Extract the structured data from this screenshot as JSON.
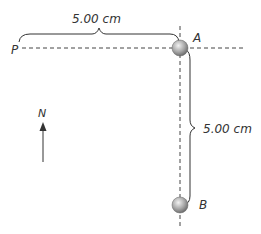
{
  "diagram": {
    "top_distance_label": "5.00 cm",
    "side_distance_label": "5.00 cm",
    "point_p_label": "P",
    "ball_a_label": "A",
    "ball_b_label": "B",
    "north_label": "N",
    "colors": {
      "line": "#333333",
      "ball_light": "#e6e6e6",
      "ball_dark": "#7a7a7a"
    }
  }
}
